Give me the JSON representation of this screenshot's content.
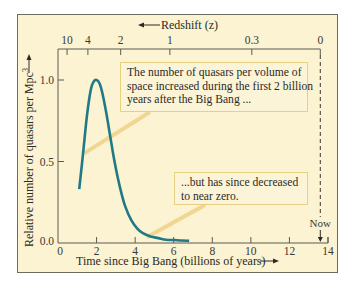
{
  "chart_data": {
    "type": "line",
    "title": "",
    "xlabel": "Time since Big Bang (billions of years)",
    "ylabel": "Relative number of quasars per Mpc",
    "ylabel_superscript": "3",
    "top_axis_label": "Redshift (z)",
    "xlim": [
      0,
      14
    ],
    "ylim": [
      0,
      1.15
    ],
    "x_ticks": [
      0,
      2,
      4,
      6,
      8,
      10,
      12,
      14
    ],
    "y_ticks": [
      0.0,
      0.5,
      1.0
    ],
    "y_tick_labels": [
      "0.0",
      "0.5",
      "1.0"
    ],
    "top_ticks": [
      {
        "label": "10",
        "t": 0.47
      },
      {
        "label": "4",
        "t": 1.55
      },
      {
        "label": "2",
        "t": 3.25
      },
      {
        "label": "1",
        "t": 5.8
      },
      {
        "label": "0.3",
        "t": 10.05
      },
      {
        "label": "0",
        "t": 13.6
      }
    ],
    "grid": false,
    "series": [
      {
        "name": "Quasar density",
        "color": "#1f7a86",
        "x": [
          1.1,
          1.3,
          1.5,
          1.7,
          1.85,
          2.0,
          2.15,
          2.3,
          2.5,
          2.7,
          2.9,
          3.1,
          3.3,
          3.5,
          3.8,
          4.1,
          4.4,
          4.8,
          5.2,
          5.6,
          6.0,
          6.4,
          6.8
        ],
        "values": [
          0.33,
          0.55,
          0.78,
          0.94,
          0.99,
          1.0,
          0.98,
          0.92,
          0.8,
          0.66,
          0.52,
          0.4,
          0.3,
          0.22,
          0.14,
          0.09,
          0.06,
          0.04,
          0.03,
          0.02,
          0.018,
          0.015,
          0.013
        ]
      }
    ],
    "annotations": [
      {
        "text": "The number of quasars per volume of space increased during the first 2 billion years after the Big Bang ...",
        "points_to": [
          1.3,
          0.55
        ]
      },
      {
        "text": "...but has since decreased to near zero.",
        "points_to": [
          4.6,
          0.03
        ]
      },
      {
        "text": "Now",
        "x": 13.7,
        "style": "dashed vertical line"
      }
    ]
  },
  "labels": {
    "redshift": "Redshift (z)",
    "xaxis": "Time since Big Bang (billions of years)",
    "yaxis": "Relative number of quasars per Mpc",
    "yaxis_sup": "3",
    "now": "Now",
    "callout_top_lines": [
      "The number of quasars per volume of",
      "space increased during the first 2 billion",
      "years after the Big Bang ..."
    ],
    "callout_bottom_lines": [
      "...but has since decreased",
      "to near zero."
    ]
  },
  "colors": {
    "background": "#fbf3d2",
    "curve": "#1f7a86",
    "axis": "#5d5a52",
    "callout_border": "#e8cf86",
    "leader": "#f0d690"
  }
}
